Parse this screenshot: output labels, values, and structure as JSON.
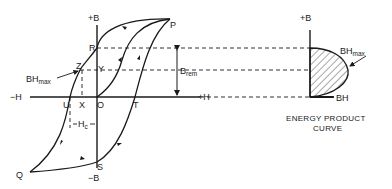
{
  "hysteresis": {
    "axis_plus_b": "+B",
    "axis_minus_b": "−B",
    "axis_minus_h": "−H",
    "axis_plus_h": "+H",
    "points": {
      "P": "P",
      "Q": "Q",
      "R": "R",
      "S": "S",
      "T": "T",
      "U": "U",
      "X": "X",
      "Y": "Y",
      "Z": "Z",
      "O": "O"
    },
    "bhmax_main": "BH",
    "bhmax_sub": "max",
    "hc_main": "H",
    "hc_sub": "c",
    "brem_main": "B",
    "brem_sub": "rem"
  },
  "energy_curve": {
    "axis_plus_b": "+B",
    "axis_bh": "BH",
    "bhmax_main": "BH",
    "bhmax_sub": "max",
    "caption_line1": "ENERGY PRODUCT",
    "caption_line2": "CURVE"
  }
}
